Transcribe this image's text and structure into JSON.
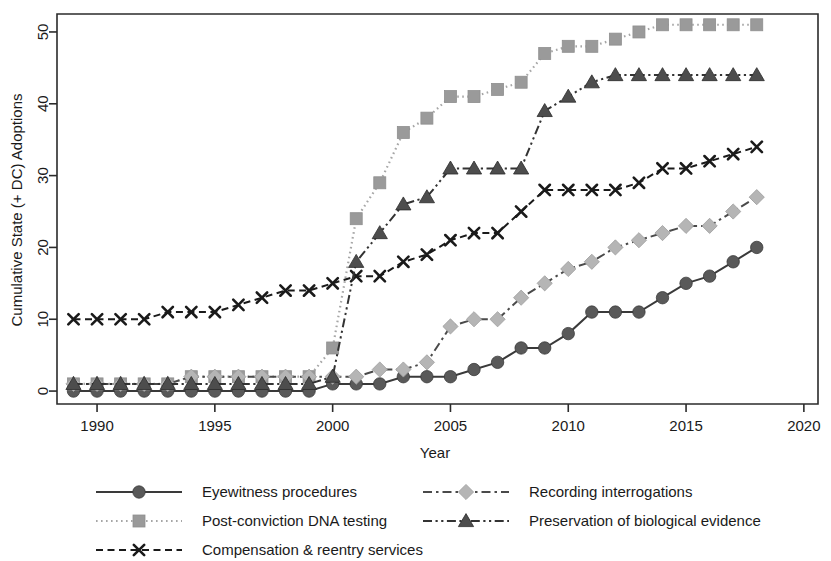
{
  "chart_data": {
    "type": "line",
    "title": "",
    "xlabel": "Year",
    "ylabel": "Cumulative State (+ DC) Adoptions",
    "xlim": [
      1988.3,
      2020.6
    ],
    "ylim": [
      -1.8,
      52.5
    ],
    "xticks": [
      1990,
      1995,
      2000,
      2005,
      2010,
      2015,
      2020
    ],
    "xtick_labels": [
      "1990",
      "1995",
      "2000",
      "2005",
      "2010",
      "2015",
      "2020"
    ],
    "yticks": [
      0,
      10,
      20,
      30,
      40,
      50
    ],
    "ytick_labels": [
      "0",
      "10",
      "20",
      "30",
      "40",
      "50"
    ],
    "grid": false,
    "legend_position": "below-axes",
    "x": [
      1989,
      1990,
      1991,
      1992,
      1993,
      1994,
      1995,
      1996,
      1997,
      1998,
      1999,
      2000,
      2001,
      2002,
      2003,
      2004,
      2005,
      2006,
      2007,
      2008,
      2009,
      2010,
      2011,
      2012,
      2013,
      2014,
      2015,
      2016,
      2017,
      2018
    ],
    "series": [
      {
        "name": "Eyewitness procedures",
        "key": "eyewitness",
        "marker": "circle",
        "dash": "solid",
        "color": "#595959",
        "line_color": "#3a3a3a",
        "values": [
          0,
          0,
          0,
          0,
          0,
          0,
          0,
          0,
          0,
          0,
          0,
          1,
          1,
          1,
          2,
          2,
          2,
          3,
          4,
          6,
          6,
          8,
          11,
          11,
          11,
          13,
          15,
          16,
          18,
          20
        ]
      },
      {
        "name": "Post-conviction DNA testing",
        "key": "dna_testing",
        "marker": "square",
        "dash": "dotted",
        "color": "#9a9a9a",
        "line_color": "#a6a6a6",
        "values": [
          1,
          1,
          1,
          1,
          1,
          2,
          2,
          2,
          2,
          2,
          2,
          6,
          24,
          29,
          36,
          38,
          41,
          41,
          42,
          43,
          47,
          48,
          48,
          49,
          50,
          51,
          51,
          51,
          51,
          51
        ]
      },
      {
        "name": "Compensation & reentry services",
        "key": "compensation",
        "marker": "x",
        "dash": "dashed",
        "color": "#1a1a1a",
        "line_color": "#1a1a1a",
        "values": [
          10,
          10,
          10,
          10,
          11,
          11,
          11,
          12,
          13,
          14,
          14,
          15,
          16,
          16,
          18,
          19,
          21,
          22,
          22,
          25,
          28,
          28,
          28,
          28,
          29,
          31,
          31,
          32,
          33,
          34
        ]
      },
      {
        "name": "Recording interrogations",
        "key": "recording",
        "marker": "diamond",
        "dash": "dashdot",
        "color": "#b5b5b5",
        "line_color": "#4a4a4a",
        "values": [
          1,
          1,
          1,
          1,
          1,
          2,
          2,
          2,
          2,
          2,
          2,
          2,
          2,
          3,
          3,
          4,
          9,
          10,
          10,
          13,
          15,
          17,
          18,
          20,
          21,
          22,
          23,
          23,
          25,
          27
        ]
      },
      {
        "name": "Preservation of biological evidence",
        "key": "preservation",
        "marker": "triangle",
        "dash": "dashdotdot",
        "color": "#4d4d4d",
        "line_color": "#333333",
        "values": [
          1,
          1,
          1,
          1,
          1,
          1,
          1,
          1,
          1,
          1,
          1,
          2,
          18,
          22,
          26,
          27,
          31,
          31,
          31,
          31,
          39,
          41,
          43,
          44,
          44,
          44,
          44,
          44,
          44,
          44
        ]
      }
    ]
  },
  "legend": {
    "entries": [
      {
        "label": "Eyewitness procedures",
        "series_key": "eyewitness"
      },
      {
        "label": "Post-conviction DNA testing",
        "series_key": "dna_testing"
      },
      {
        "label": "Compensation & reentry services",
        "series_key": "compensation"
      },
      {
        "label": "Recording interrogations",
        "series_key": "recording"
      },
      {
        "label": "Preservation of biological evidence",
        "series_key": "preservation"
      }
    ]
  }
}
